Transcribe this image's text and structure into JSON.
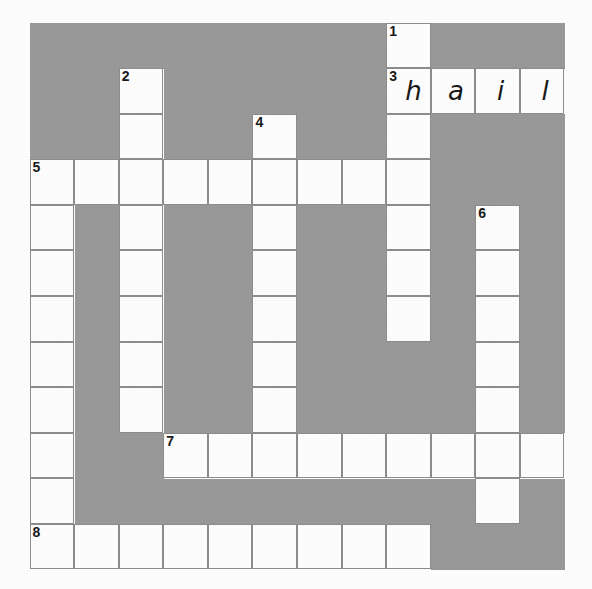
{
  "puzzle": {
    "type": "crossword-grid",
    "rows": 12,
    "columns": 12,
    "block_color": "#9a9a9a",
    "open_color": "#ffffff",
    "border_color": "#8e8e8e",
    "text_color": "#1a1a1a",
    "clue_numbers": [
      {
        "number": "1",
        "row": 0,
        "col": 8
      },
      {
        "number": "2",
        "row": 1,
        "col": 2
      },
      {
        "number": "3",
        "row": 1,
        "col": 8
      },
      {
        "number": "4",
        "row": 2,
        "col": 5
      },
      {
        "number": "5",
        "row": 3,
        "col": 0
      },
      {
        "number": "6",
        "row": 4,
        "col": 10
      },
      {
        "number": "7",
        "row": 9,
        "col": 3
      },
      {
        "number": "8",
        "row": 11,
        "col": 0
      }
    ],
    "filled_letters": [
      {
        "letter": "h",
        "row": 1,
        "col": 8
      },
      {
        "letter": "a",
        "row": 1,
        "col": 9
      },
      {
        "letter": "i",
        "row": 1,
        "col": 10
      },
      {
        "letter": "l",
        "row": 1,
        "col": 11
      }
    ],
    "answers_shown": [
      {
        "number": "3",
        "direction": "across",
        "text": "hail"
      }
    ],
    "cells": [
      [
        "block",
        "block",
        "block",
        "block",
        "block",
        "block",
        "block",
        "block",
        "open",
        "block",
        "block",
        "block"
      ],
      [
        "block",
        "block",
        "open",
        "block",
        "block",
        "block",
        "block",
        "block",
        "open",
        "open",
        "open",
        "open"
      ],
      [
        "block",
        "block",
        "open",
        "block",
        "block",
        "open",
        "block",
        "block",
        "open",
        "block",
        "block",
        "block"
      ],
      [
        "open",
        "open",
        "open",
        "open",
        "open",
        "open",
        "open",
        "open",
        "open",
        "block",
        "block",
        "block"
      ],
      [
        "open",
        "block",
        "open",
        "block",
        "block",
        "open",
        "block",
        "block",
        "open",
        "block",
        "open",
        "block"
      ],
      [
        "open",
        "block",
        "open",
        "block",
        "block",
        "open",
        "block",
        "block",
        "open",
        "block",
        "open",
        "block"
      ],
      [
        "open",
        "block",
        "open",
        "block",
        "block",
        "open",
        "block",
        "block",
        "open",
        "block",
        "open",
        "block"
      ],
      [
        "open",
        "block",
        "open",
        "block",
        "block",
        "open",
        "block",
        "block",
        "block",
        "block",
        "open",
        "block"
      ],
      [
        "open",
        "block",
        "open",
        "block",
        "block",
        "open",
        "block",
        "block",
        "block",
        "block",
        "open",
        "block"
      ],
      [
        "open",
        "block",
        "block",
        "open",
        "open",
        "open",
        "open",
        "open",
        "open",
        "open",
        "open",
        "open"
      ],
      [
        "open",
        "block",
        "block",
        "block",
        "block",
        "block",
        "block",
        "block",
        "block",
        "block",
        "open",
        "block"
      ],
      [
        "open",
        "open",
        "open",
        "open",
        "open",
        "open",
        "open",
        "open",
        "open",
        "block",
        "block",
        "block"
      ]
    ]
  }
}
